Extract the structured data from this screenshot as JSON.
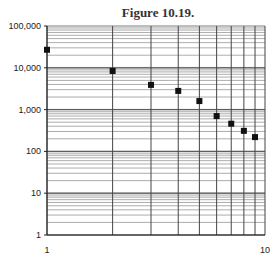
{
  "chart_data": {
    "type": "scatter",
    "title": "Figure 10.19.",
    "xlabel": "",
    "ylabel": "",
    "xscale": "log",
    "yscale": "log",
    "xlim": [
      1,
      10
    ],
    "ylim": [
      1,
      100000
    ],
    "grid": true,
    "legend": null,
    "x_tick_labels": [
      "1",
      "10"
    ],
    "y_tick_labels": [
      "1",
      "10",
      "100",
      "1,000",
      "10,000",
      "100,000"
    ],
    "x": [
      1,
      2,
      3,
      4,
      5,
      6,
      7,
      8,
      9
    ],
    "y": [
      27000,
      8400,
      3900,
      2800,
      1600,
      700,
      460,
      310,
      220
    ],
    "marker": "square",
    "marker_color": "#111111"
  }
}
